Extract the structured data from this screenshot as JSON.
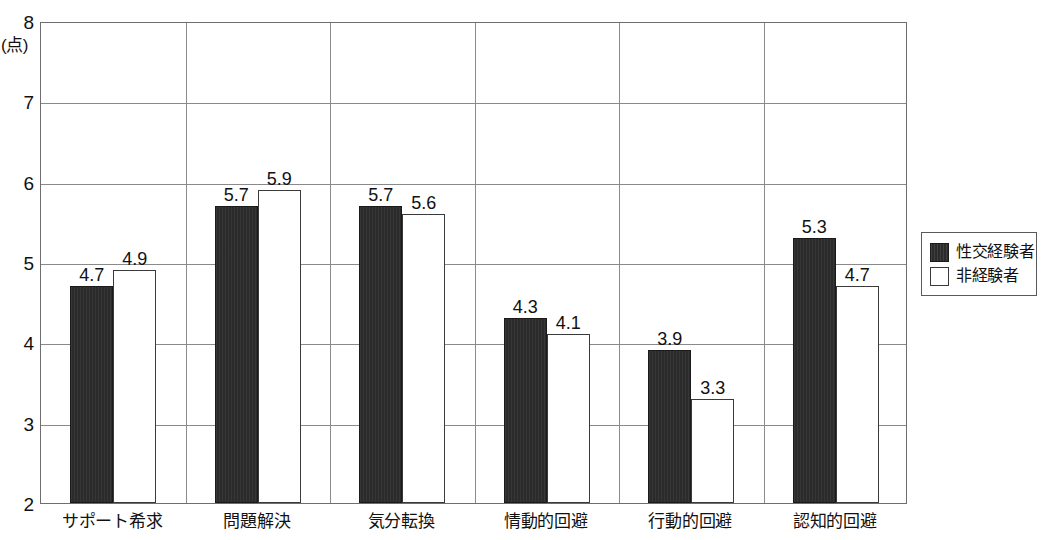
{
  "chart_data": {
    "type": "bar",
    "title": "",
    "xlabel": "",
    "ylabel": "(点)",
    "ylim": [
      2,
      8
    ],
    "yticks": [
      2,
      3,
      4,
      5,
      6,
      7,
      8
    ],
    "ytick_labels": [
      "2",
      "3",
      "4",
      "5",
      "6",
      "7",
      "8"
    ],
    "grid": true,
    "legend_position": "right",
    "categories": [
      "サポート希求",
      "問題解決",
      "気分転換",
      "情動的回避",
      "行動的回避",
      "認知的回避"
    ],
    "series": [
      {
        "name": "性交経験者",
        "color": "#2b2b2b",
        "values": [
          4.7,
          5.7,
          5.7,
          4.3,
          3.9,
          5.3
        ],
        "value_labels": [
          "4.7",
          "5.7",
          "5.7",
          "4.3",
          "3.9",
          "5.3"
        ]
      },
      {
        "name": "非経験者",
        "color": "#ffffff",
        "values": [
          4.9,
          5.9,
          5.6,
          4.1,
          3.3,
          4.7
        ],
        "value_labels": [
          "4.9",
          "5.9",
          "5.6",
          "4.1",
          "3.3",
          "4.7"
        ]
      }
    ]
  },
  "legend": {
    "items": [
      {
        "label": "性交経験者",
        "style": "dark"
      },
      {
        "label": "非経験者",
        "style": "light"
      }
    ]
  }
}
